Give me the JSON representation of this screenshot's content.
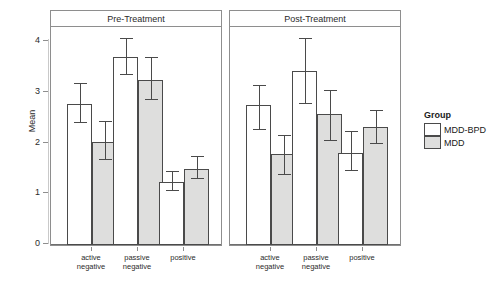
{
  "chart_data": {
    "type": "bar",
    "title": "",
    "xlabel": "",
    "ylabel": "Mean",
    "ylim": [
      0,
      4.35
    ],
    "yticks": [
      0,
      1,
      2,
      3,
      4
    ],
    "ytick_labels": [
      "0",
      "1",
      "2",
      "3",
      "4"
    ],
    "grid": false,
    "legend_position": "right",
    "legend_title": "Group",
    "panels": [
      {
        "label": "Pre-Treatment",
        "categories": [
          "active negative",
          "passive negative",
          "positive"
        ],
        "series": [
          {
            "name": "MDD-BPD",
            "color": "#ffffff",
            "values": [
              2.77,
              3.68,
              1.24
            ],
            "err_low": [
              2.39,
              3.34,
              1.05
            ],
            "err_high": [
              3.16,
              4.03,
              1.43
            ]
          },
          {
            "name": "MDD",
            "color": "#dededd",
            "values": [
              2.02,
              3.24,
              1.5
            ],
            "err_low": [
              1.66,
              2.85,
              1.29
            ],
            "err_high": [
              2.41,
              3.67,
              1.72
            ]
          }
        ]
      },
      {
        "label": "Post-Treatment",
        "categories": [
          "active negative",
          "passive negative",
          "positive"
        ],
        "series": [
          {
            "name": "MDD-BPD",
            "color": "#ffffff",
            "values": [
              2.74,
              3.42,
              1.8
            ],
            "err_low": [
              2.25,
              2.77,
              1.45
            ],
            "err_high": [
              3.12,
              4.03,
              2.22
            ]
          },
          {
            "name": "MDD",
            "color": "#dededd",
            "values": [
              1.79,
              2.57,
              2.31
            ],
            "err_low": [
              1.38,
              2.03,
              1.99
            ],
            "err_high": [
              2.13,
              3.02,
              2.62
            ]
          }
        ]
      }
    ]
  },
  "axis": {
    "y_title": "Mean",
    "y_tick_0": "0",
    "y_tick_1": "1",
    "y_tick_2": "2",
    "y_tick_3": "3",
    "y_tick_4": "4"
  },
  "panels": {
    "pre": {
      "title": "Pre-Treatment"
    },
    "post": {
      "title": "Post-Treatment"
    }
  },
  "categories": {
    "active_negative_line1": "active",
    "active_negative_line2": "negative",
    "passive_negative_line1": "passive",
    "passive_negative_line2": "negative",
    "positive_line1": "positive"
  },
  "legend": {
    "title": "Group",
    "items": [
      {
        "label": "MDD-BPD",
        "color": "#ffffff"
      },
      {
        "label": "MDD",
        "color": "#dededd"
      }
    ]
  },
  "colors": {
    "mdd_bpd_fill": "#ffffff",
    "mdd_fill": "#dededd",
    "bar_outline": "#4a4a4a",
    "panel_border": "#8e8e8e",
    "text": "#2b2b2b"
  }
}
